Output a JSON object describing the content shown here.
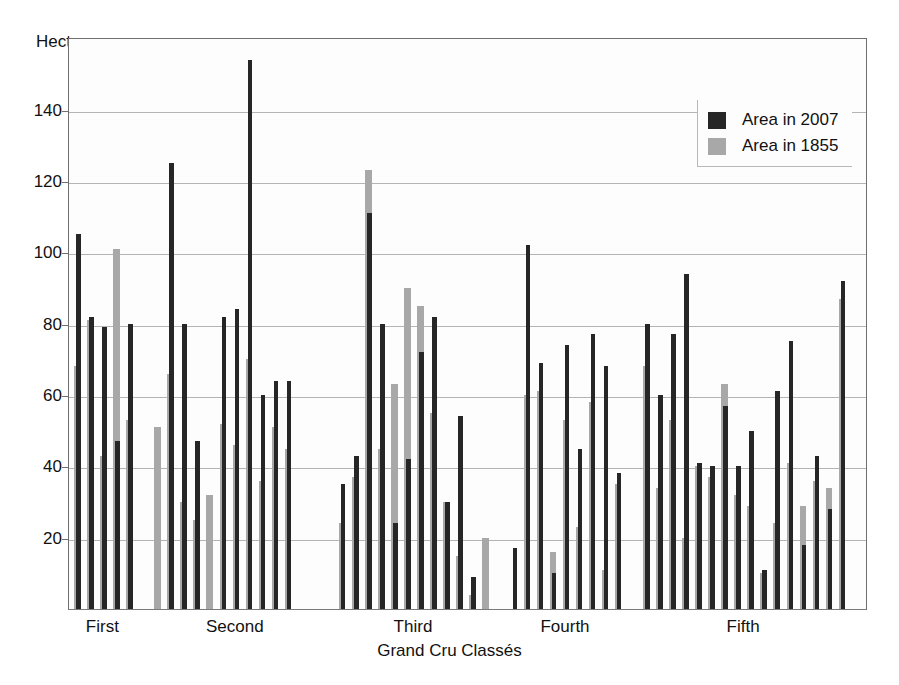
{
  "chart_data": {
    "type": "bar",
    "title": "",
    "subtitle": "",
    "ylabel": "Hectares",
    "xlabel": "Grand Cru Classés",
    "ylim": [
      0,
      158
    ],
    "yticks": [
      20,
      40,
      60,
      80,
      100,
      120,
      140
    ],
    "ytick_labels": [
      "20",
      "40",
      "60",
      "80",
      "100",
      "120",
      "140"
    ],
    "grid": true,
    "legend_position": "top-right",
    "bar_style": "overlapping-pairs",
    "series": [
      {
        "name": "Area in 2007",
        "color": "#262626",
        "values": [
          105,
          82,
          79,
          47,
          80,
          null,
          125,
          80,
          47,
          null,
          82,
          84,
          154,
          60,
          64,
          64,
          null,
          null,
          35,
          43,
          111,
          80,
          24,
          42,
          72,
          82,
          30,
          54,
          9,
          null,
          17,
          102,
          69,
          10,
          74,
          45,
          77,
          68,
          38,
          80,
          60,
          77,
          94,
          41,
          40,
          57,
          40,
          50,
          11,
          61,
          75,
          18,
          43,
          28,
          92
        ]
      },
      {
        "name": "Area in 1855",
        "color": "#a8a8a8",
        "values": [
          68,
          81,
          43,
          101,
          53,
          51,
          66,
          30,
          25,
          32,
          52,
          46,
          70,
          36,
          51,
          45,
          null,
          null,
          24,
          37,
          123,
          45,
          63,
          90,
          85,
          55,
          30,
          15,
          4,
          20,
          null,
          60,
          61,
          16,
          53,
          23,
          58,
          11,
          35,
          68,
          34,
          53,
          20,
          40,
          37,
          63,
          32,
          29,
          10,
          24,
          41,
          29,
          36,
          34,
          87
        ]
      }
    ],
    "groups": [
      {
        "label": "First",
        "count": 5
      },
      {
        "label": "Second",
        "count": 13
      },
      {
        "label": "Third",
        "count": 12
      },
      {
        "label": "Fourth",
        "count": 9
      },
      {
        "label": "Fifth",
        "count": 16
      }
    ],
    "annotations": []
  },
  "legend": {
    "items": [
      {
        "label": "Area in 2007",
        "color": "#262626"
      },
      {
        "label": "Area in 1855",
        "color": "#a8a8a8"
      }
    ]
  },
  "axes": {
    "y_title": "Hectares",
    "x_title": "Grand Cru Classés",
    "y_tick_labels": [
      "140",
      "120",
      "100",
      "80",
      "60",
      "40",
      "20"
    ],
    "x_group_labels": [
      "First",
      "Second",
      "Third",
      "Fourth",
      "Fifth"
    ]
  },
  "colors": {
    "dark_bar": "#262626",
    "light_bar": "#a8a8a8",
    "gridline": "#b4b4b4",
    "frame": "#6f6f6f",
    "background": "#ffffff"
  }
}
